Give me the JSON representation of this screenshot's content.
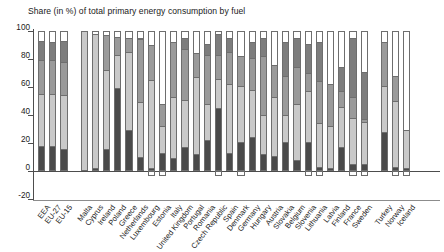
{
  "chart_data": {
    "type": "bar",
    "stacked": true,
    "title": "Share (in %) of total primary energy consumption by fuel",
    "xlabel": "",
    "ylabel": "",
    "ylim": [
      -20,
      100
    ],
    "yticks": [
      -20,
      0,
      20,
      40,
      60,
      80,
      100
    ],
    "ytick_labels": [
      "-20",
      "0",
      "20",
      "40",
      "60",
      "80",
      "100"
    ],
    "grid": false,
    "legend_position": "none",
    "series": [
      {
        "name": "Solid fuels",
        "color": "#4a4a4a"
      },
      {
        "name": "Oil",
        "color": "#c9c9c9"
      },
      {
        "name": "Gas",
        "color": "#9a9a9a"
      },
      {
        "name": "Nuclear",
        "color": "#7d7d7d"
      },
      {
        "name": "Renewables",
        "color": "#ffffff"
      }
    ],
    "categories": [
      "EEA",
      "EU-27",
      "EU-15",
      "Malta",
      "Cyprus",
      "Ireland",
      "Poland",
      "Greece",
      "Netherlands",
      "Luxembourg",
      "Estonia",
      "Italy",
      "United Kingdom",
      "Portugal",
      "Romania",
      "Czech Republic",
      "Spain",
      "Denmark",
      "Germany",
      "Hungary",
      "Austria",
      "Slovakia",
      "Belgium",
      "Slovenia",
      "Lithuania",
      "Latvia",
      "Finland",
      "France",
      "Sweden",
      "Turkey",
      "Norway",
      "Iceland"
    ],
    "group_breaks": [
      3,
      29
    ],
    "values": {
      "Solid fuels": [
        18,
        18,
        16,
        0,
        2,
        16,
        59,
        29,
        10,
        2,
        13,
        9,
        17,
        12,
        22,
        45,
        13,
        21,
        24,
        12,
        11,
        21,
        8,
        21,
        3,
        2,
        17,
        5,
        5,
        28,
        3,
        2
      ],
      "Oil": [
        37,
        37,
        38,
        100,
        96,
        56,
        24,
        56,
        39,
        63,
        19,
        44,
        34,
        55,
        26,
        21,
        49,
        40,
        34,
        28,
        42,
        19,
        40,
        36,
        31,
        30,
        29,
        33,
        30,
        33,
        47,
        27
      ],
      "Gas": [
        24,
        24,
        24,
        0,
        0,
        25,
        13,
        10,
        45,
        25,
        16,
        39,
        36,
        17,
        35,
        17,
        23,
        21,
        23,
        42,
        23,
        28,
        26,
        13,
        30,
        30,
        11,
        15,
        2,
        31,
        18,
        0
      ],
      "Nuclear": [
        14,
        13,
        15,
        0,
        0,
        0,
        0,
        0,
        1,
        0,
        0,
        0,
        8,
        0,
        8,
        15,
        10,
        0,
        11,
        13,
        0,
        24,
        21,
        21,
        28,
        0,
        17,
        42,
        34,
        0,
        0,
        0
      ],
      "Renewables": [
        7,
        8,
        7,
        0,
        2,
        3,
        4,
        5,
        5,
        10,
        52,
        8,
        5,
        16,
        9,
        2,
        5,
        18,
        8,
        5,
        24,
        8,
        5,
        9,
        8,
        38,
        26,
        5,
        29,
        8,
        32,
        71
      ]
    },
    "net_imports": [
      0,
      0,
      0,
      0,
      0,
      0,
      0,
      0,
      0,
      10,
      0,
      0,
      0,
      0,
      0,
      0,
      0,
      0,
      0,
      0,
      0,
      0,
      0,
      0,
      0,
      0,
      0,
      0,
      0,
      0,
      0,
      0
    ],
    "negative_markers": [
      "Luxembourg",
      "Estonia",
      "Czech Republic",
      "Denmark",
      "Slovenia",
      "Lithuania",
      "France",
      "Sweden",
      "Norway",
      "Iceland"
    ]
  }
}
